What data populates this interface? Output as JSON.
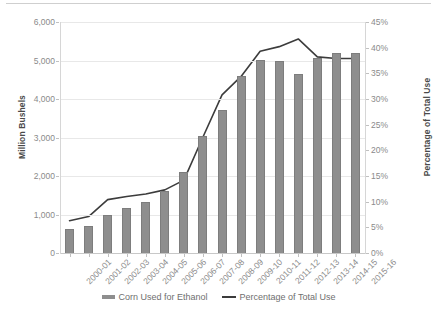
{
  "chart_data": {
    "type": "bar",
    "title": "",
    "xlabel": "",
    "ylabel": "Million Bushels",
    "y2label": "Percentage of Total Use",
    "grid": true,
    "legend_position": "bottom",
    "categories": [
      "2000-01",
      "2001-02",
      "2002-03",
      "2003-04",
      "2004-05",
      "2005-06",
      "2006-07",
      "2007-08",
      "2008-09",
      "2009-10",
      "2010-11",
      "2011-12",
      "2012-13",
      "2013-14",
      "2014-15",
      "2015-16"
    ],
    "ylim": [
      0,
      6000
    ],
    "y2lim": [
      0,
      45
    ],
    "yticks": [
      "0",
      "1,000",
      "2,000",
      "3,000",
      "4,000",
      "5,000",
      "6,000"
    ],
    "ytick_values": [
      0,
      1000,
      2000,
      3000,
      4000,
      5000,
      6000
    ],
    "y2ticks": [
      "0%",
      "5%",
      "10%",
      "15%",
      "20%",
      "25%",
      "30%",
      "35%",
      "40%",
      "45%"
    ],
    "y2tick_values": [
      0,
      5,
      10,
      15,
      20,
      25,
      30,
      35,
      40,
      45
    ],
    "series": [
      {
        "name": "Corn Used for Ethanol",
        "type": "bar",
        "axis": "left",
        "unit": "Million Bushels",
        "color": "#8e8e8e",
        "values": [
          630,
          700,
          996,
          1168,
          1323,
          1603,
          2117,
          3049,
          3709,
          4591,
          5019,
          5000,
          4641,
          5060,
          5200,
          5200
        ]
      },
      {
        "name": "Percentage of Total Use",
        "type": "line",
        "axis": "right",
        "unit": "%",
        "color": "#3c3c3c",
        "values": [
          6.3,
          7.1,
          10.4,
          11.0,
          11.5,
          12.3,
          14.2,
          22.6,
          30.8,
          34.4,
          39.3,
          40.2,
          41.7,
          38.2,
          37.9,
          37.9
        ]
      }
    ]
  },
  "legend": {
    "items": [
      {
        "label": "Corn Used for Ethanol",
        "marker": "bar-swatch-icon"
      },
      {
        "label": "Percentage of Total Use",
        "marker": "line-swatch-icon"
      }
    ]
  }
}
